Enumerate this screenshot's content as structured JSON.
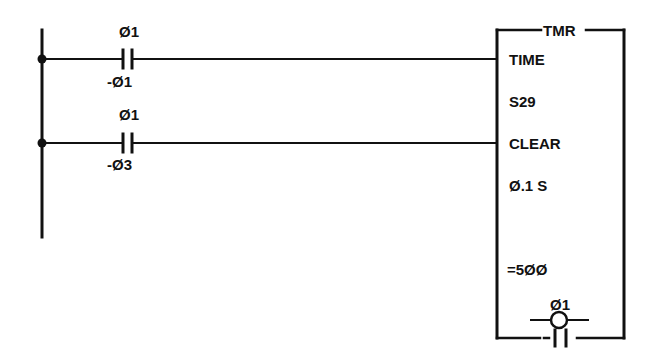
{
  "diagram": {
    "type": "ladder-logic",
    "colors": {
      "ink": "#111111",
      "background": "#ffffff"
    },
    "left_rail": {
      "x": 42,
      "y_top": 30,
      "y_bottom": 237
    },
    "rungs": [
      {
        "id": "rung-1",
        "y": 59,
        "contact": {
          "type": "normally-open",
          "label_top": "Ø1",
          "label_bottom": "-Ø1"
        },
        "target": "TIME"
      },
      {
        "id": "rung-2",
        "y": 143,
        "contact": {
          "type": "normally-open",
          "label_top": "Ø1",
          "label_bottom": "-Ø3"
        },
        "target": "CLEAR"
      }
    ],
    "timer_block": {
      "title": "TMR",
      "inputs": [
        "TIME",
        "CLEAR"
      ],
      "register": "S29",
      "timebase": "Ø.1 S",
      "preset": "=5ØØ",
      "output_coil": {
        "label": "Ø1",
        "type": "coil"
      },
      "output_contact": {
        "label": "-11",
        "type": "normally-open"
      }
    }
  }
}
